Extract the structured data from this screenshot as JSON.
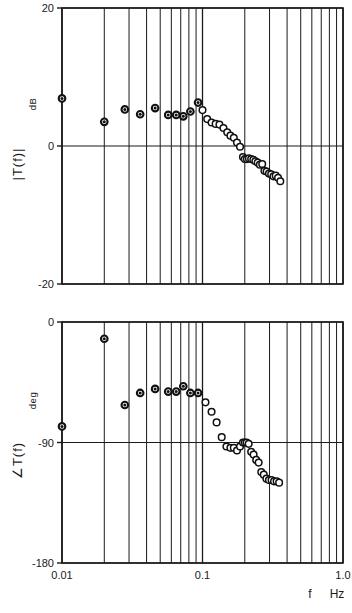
{
  "figure": {
    "xaxis_name": "f",
    "xaxis_unit": "Hz"
  },
  "chart_data": [
    {
      "type": "scatter",
      "title": "",
      "panel": "magnitude",
      "xlabel": "f",
      "xunit": "Hz",
      "ylabel": "|T(f)|",
      "yunit": "dB",
      "xscale": "log",
      "xlim": [
        0.01,
        1.0
      ],
      "ylim": [
        -20,
        20
      ],
      "xtick_labels": [
        "0.01",
        "0.1",
        "1.0"
      ],
      "xticks": [
        0.01,
        0.1,
        1.0
      ],
      "ytick_labels": [
        "20",
        "0",
        "-20"
      ],
      "yticks": [
        20,
        0,
        -20
      ],
      "grid": "vertical-log-minor",
      "legend": "none",
      "series": [
        {
          "name": "filled",
          "marker": "filled-circle-dot",
          "x": [
            0.01,
            0.02,
            0.028,
            0.036,
            0.046,
            0.057,
            0.065,
            0.073,
            0.082,
            0.093
          ],
          "y": [
            6.9,
            3.5,
            5.3,
            4.6,
            5.5,
            4.5,
            4.5,
            4.3,
            5.0,
            6.3
          ]
        },
        {
          "name": "open",
          "marker": "open-circle",
          "x": [
            0.1,
            0.108,
            0.116,
            0.124,
            0.132,
            0.141,
            0.15,
            0.158,
            0.167,
            0.176,
            0.185,
            0.194,
            0.2,
            0.207,
            0.214,
            0.222,
            0.23,
            0.238,
            0.247,
            0.256,
            0.266,
            0.276,
            0.286,
            0.297,
            0.308,
            0.32,
            0.332,
            0.345,
            0.358
          ],
          "y": [
            5.2,
            3.9,
            3.4,
            3.2,
            3.1,
            2.6,
            2.0,
            1.5,
            1.2,
            0.5,
            -0.1,
            -1.6,
            -1.9,
            -1.9,
            -1.8,
            -1.9,
            -2.0,
            -2.2,
            -2.4,
            -2.7,
            -2.6,
            -3.6,
            -3.7,
            -4.0,
            -4.1,
            -4.4,
            -4.3,
            -4.6,
            -5.1
          ]
        }
      ]
    },
    {
      "type": "scatter",
      "title": "",
      "panel": "phase",
      "xlabel": "f",
      "xunit": "Hz",
      "ylabel": "∠T(f)",
      "yunit": "deg",
      "xscale": "log",
      "xlim": [
        0.01,
        1.0
      ],
      "ylim": [
        -180,
        0
      ],
      "xtick_labels": [
        "0.01",
        "0.1",
        "1.0"
      ],
      "xticks": [
        0.01,
        0.1,
        1.0
      ],
      "ytick_labels": [
        "0",
        "-90",
        "-180"
      ],
      "yticks": [
        0,
        -90,
        -180
      ],
      "grid": "vertical-log-minor",
      "legend": "none",
      "series": [
        {
          "name": "filled",
          "marker": "filled-circle-dot",
          "x": [
            0.01,
            0.02,
            0.028,
            0.036,
            0.046,
            0.057,
            0.065,
            0.073,
            0.082,
            0.093
          ],
          "y": [
            -78.0,
            -12.5,
            -62.0,
            -53.0,
            -50.0,
            -52.0,
            -52.0,
            -48.0,
            -53.0,
            -53.0
          ]
        },
        {
          "name": "open",
          "marker": "open-circle",
          "x": [
            0.105,
            0.116,
            0.126,
            0.137,
            0.148,
            0.158,
            0.167,
            0.176,
            0.185,
            0.194,
            0.2,
            0.206,
            0.213,
            0.222,
            0.231,
            0.241,
            0.251,
            0.262,
            0.273,
            0.285,
            0.297,
            0.31,
            0.323,
            0.337,
            0.351
          ],
          "y": [
            -60.0,
            -67.0,
            -75.0,
            -86.0,
            -93.0,
            -94.0,
            -94.0,
            -96.0,
            -93.0,
            -90.0,
            -90.0,
            -90.0,
            -91.0,
            -97.0,
            -99.0,
            -103.0,
            -105.0,
            -112.0,
            -114.0,
            -117.0,
            -118.0,
            -118.0,
            -119.0,
            -119.0,
            -120.0
          ]
        }
      ]
    }
  ]
}
